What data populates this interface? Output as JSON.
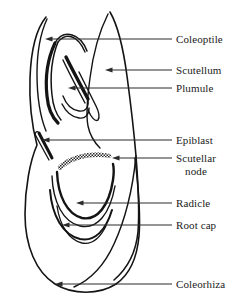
{
  "figure": {
    "background_color": "#ffffff",
    "ink_color": "#141414",
    "leader_color": "#2b2b2b",
    "width": 242,
    "height": 307
  },
  "labels": [
    {
      "key": "coleoptile",
      "text": "Coleoptile",
      "lines": [
        "Coleoptile"
      ],
      "x": 176,
      "y": 33,
      "leader": {
        "x1": 172,
        "y1": 39,
        "x2": 45,
        "y2": 39
      },
      "arrow_at": {
        "x": 45,
        "y": 39
      }
    },
    {
      "key": "scutellum",
      "text": "Scutellum",
      "lines": [
        "Scutellum"
      ],
      "x": 176,
      "y": 64,
      "leader": {
        "x1": 172,
        "y1": 70,
        "x2": 105,
        "y2": 70
      },
      "arrow_at": {
        "x": 105,
        "y": 70
      }
    },
    {
      "key": "plumule",
      "text": "Plumule",
      "lines": [
        "Plumule"
      ],
      "x": 176,
      "y": 82,
      "leader": {
        "x1": 172,
        "y1": 88,
        "x2": 68,
        "y2": 88
      },
      "arrow_at": {
        "x": 68,
        "y": 88
      }
    },
    {
      "key": "epiblast",
      "text": "Epiblast",
      "lines": [
        "Epiblast"
      ],
      "x": 176,
      "y": 134,
      "leader": {
        "x1": 172,
        "y1": 140,
        "x2": 42,
        "y2": 140
      },
      "arrow_at": {
        "x": 42,
        "y": 140
      }
    },
    {
      "key": "scutellar-node",
      "text": "Scutellar node",
      "lines": [
        "Scutellar",
        "node"
      ],
      "x": 176,
      "y": 152,
      "leader": {
        "x1": 172,
        "y1": 158,
        "x2": 112,
        "y2": 158
      },
      "arrow_at": {
        "x": 112,
        "y": 158
      }
    },
    {
      "key": "radicle",
      "text": "Radicle",
      "lines": [
        "Radicle"
      ],
      "x": 176,
      "y": 197,
      "leader": {
        "x1": 172,
        "y1": 203,
        "x2": 76,
        "y2": 203
      },
      "arrow_at": {
        "x": 76,
        "y": 203
      }
    },
    {
      "key": "root-cap",
      "text": "Root cap",
      "lines": [
        "Root cap"
      ],
      "x": 176,
      "y": 219,
      "leader": {
        "x1": 172,
        "y1": 225,
        "x2": 62,
        "y2": 225
      },
      "arrow_at": {
        "x": 62,
        "y": 225
      }
    },
    {
      "key": "coleorhiza",
      "text": "Coleorhiza",
      "lines": [
        "Coleorhiza"
      ],
      "x": 176,
      "y": 278,
      "leader": {
        "x1": 172,
        "y1": 284,
        "x2": 55,
        "y2": 284
      },
      "arrow_at": {
        "x": 55,
        "y": 284
      }
    }
  ]
}
